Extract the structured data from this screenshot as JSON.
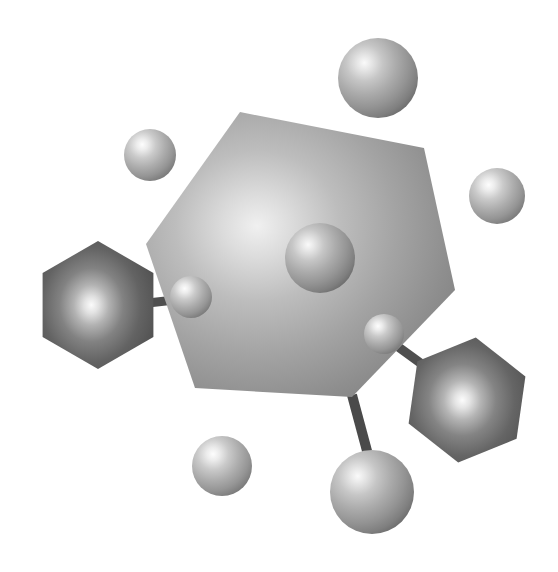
{
  "illustration": {
    "title": "Molecular Structure Illustration",
    "subject": "abstract molecule with hexagonal rings and spherical atoms",
    "style": "grayscale airbrush rendering",
    "background_color": "#ffffff",
    "canvas": {
      "width": 558,
      "height": 572
    }
  },
  "palette": {
    "background": "#ffffff",
    "hex_large_light": "#d8d8d8",
    "hex_large_mid": "#a8a8a8",
    "hex_large_dark": "#787878",
    "hex_small_light": "#f2f2f2",
    "hex_small_mid": "#8a8a8a",
    "hex_small_dark": "#4a4a4a",
    "sphere_light": "#f4f4f4",
    "sphere_mid": "#b4b4b4",
    "sphere_dark": "#6e6e6e",
    "sphere_edge": "#5a5a5a",
    "bond": "#4f4f4f"
  },
  "shapes": {
    "hexagons": [
      {
        "id": "central-ring",
        "label": "large central hexagon",
        "cx": 300,
        "cy": 278,
        "radius": 168,
        "rotation_deg": 12,
        "tone": "light",
        "highlight": {
          "x": 36,
          "y": 40
        }
      },
      {
        "id": "left-ring",
        "label": "left dark hexagon",
        "cx": 98,
        "cy": 305,
        "radius": 64,
        "rotation_deg": 0,
        "tone": "dark",
        "highlight": {
          "x": 44,
          "y": 50
        }
      },
      {
        "id": "right-ring",
        "label": "lower right dark hexagon",
        "cx": 467,
        "cy": 400,
        "radius": 63,
        "rotation_deg": 8,
        "tone": "dark",
        "highlight": {
          "x": 46,
          "y": 50
        }
      }
    ],
    "spheres": [
      {
        "id": "atom-top-right",
        "label": "upper right large sphere",
        "cx": 378,
        "cy": 78,
        "r": 40,
        "tone": "mid"
      },
      {
        "id": "atom-top-left",
        "label": "upper left small sphere",
        "cx": 150,
        "cy": 155,
        "r": 26,
        "tone": "mid"
      },
      {
        "id": "atom-right-edge",
        "label": "right edge small sphere",
        "cx": 497,
        "cy": 196,
        "r": 28,
        "tone": "mid"
      },
      {
        "id": "atom-core",
        "label": "central sphere on ring",
        "cx": 320,
        "cy": 258,
        "r": 35,
        "tone": "mid"
      },
      {
        "id": "atom-left-bond",
        "label": "left bonded small sphere",
        "cx": 191,
        "cy": 297,
        "r": 21,
        "tone": "mid"
      },
      {
        "id": "atom-right-bond",
        "label": "right bonded small sphere",
        "cx": 384,
        "cy": 334,
        "r": 20,
        "tone": "mid"
      },
      {
        "id": "atom-bottom-left",
        "label": "lower left sphere",
        "cx": 222,
        "cy": 466,
        "r": 30,
        "tone": "mid"
      },
      {
        "id": "atom-bottom",
        "label": "lower center large sphere",
        "cx": 372,
        "cy": 492,
        "r": 42,
        "tone": "mid"
      }
    ],
    "bonds": [
      {
        "id": "bond-left",
        "label": "left hexagon to small sphere bond",
        "x1": 148,
        "y1": 303,
        "x2": 190,
        "y2": 298,
        "width": 9
      },
      {
        "id": "bond-right",
        "label": "small sphere to right hexagon bond",
        "x1": 389,
        "y1": 341,
        "x2": 425,
        "y2": 367,
        "width": 9
      },
      {
        "id": "bond-bottom",
        "label": "central ring to lower sphere bond",
        "x1": 353,
        "y1": 397,
        "x2": 370,
        "y2": 462,
        "width": 10
      }
    ]
  },
  "counts": {
    "hexagons": 3,
    "spheres": 8,
    "bonds": 3
  }
}
